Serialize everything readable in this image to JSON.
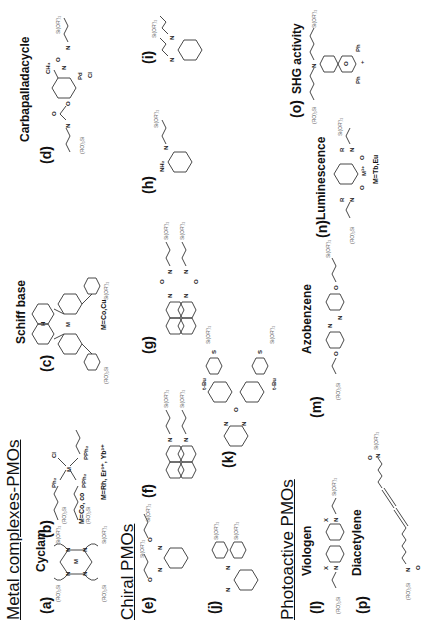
{
  "sections": {
    "metal": "Metal complexes-PMOs",
    "chiral": "Chiral PMOs",
    "photo": "Photoactive PMOs"
  },
  "items": {
    "a": {
      "label": "(a)",
      "name": "Cyclam",
      "note": "M=Co, co"
    },
    "b": {
      "label": "(b)",
      "name": "",
      "note": "M=Rh, Er³⁺, Yb³⁺"
    },
    "c": {
      "label": "(c)",
      "name": "Schiff base",
      "note": "M=Co,Cu"
    },
    "d": {
      "label": "(d)",
      "name": "Carbapalladacycle",
      "note": ""
    },
    "e": {
      "label": "(e)"
    },
    "f": {
      "label": "(f)"
    },
    "g": {
      "label": "(g)"
    },
    "h": {
      "label": "(h)"
    },
    "i": {
      "label": "(i)"
    },
    "j": {
      "label": "(j)"
    },
    "k": {
      "label": "(k)"
    },
    "l": {
      "label": "(l)",
      "name": "Viologen"
    },
    "m": {
      "label": "(m)",
      "name": "Azobenzene"
    },
    "n": {
      "label": "(n)",
      "name": "Luminescence",
      "note": "M=Tb,Eu"
    },
    "o": {
      "label": "(o)",
      "name": "SHG activity"
    },
    "p": {
      "label": "(p)",
      "name": "Diacetylene"
    }
  },
  "chem_labels": {
    "si_r": "(RO)₃Si",
    "si_l": "Si(OR')₃",
    "N": "N",
    "M": "M",
    "H": "H",
    "O": "O",
    "Pd": "Pd",
    "Cl": "Cl",
    "CH3": "CH₃",
    "Ph2": "Ph₂",
    "PPh2": "PPh₂",
    "Cl1": "Cl",
    "NH2": "NH₂",
    "S": "S",
    "tBu": "t-Bu",
    "X": "X",
    "R": "R",
    "Ph": "Ph",
    "plus": "+",
    "M3": "M³⁺"
  }
}
